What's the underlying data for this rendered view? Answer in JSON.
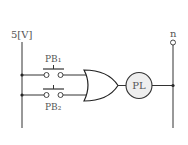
{
  "diagram": {
    "type": "logic-circuit",
    "supply_label": "5[V]",
    "neutral_label": "n",
    "switches": [
      {
        "id": "PB1",
        "label": "PB₁",
        "type": "normally-open push button"
      },
      {
        "id": "PB2",
        "label": "PB₂",
        "type": "normally-open push button"
      }
    ],
    "gate": {
      "type": "OR",
      "inputs": 2
    },
    "lamp": {
      "label": "PL",
      "fill": "#eeeeee"
    },
    "colors": {
      "line": "#333333",
      "text": "#555555"
    }
  }
}
